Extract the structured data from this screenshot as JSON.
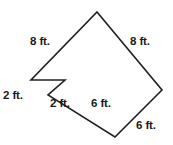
{
  "figure": {
    "shape_name": "notched-square-polygon",
    "stroke_color": "#231f20",
    "fill_color": "#ffffff",
    "background_color": "#ffffff",
    "stroke_width": 1.6,
    "unit": "ft.",
    "outline_points": "97,12 162,90 115,137 48,95 65,80 31,80",
    "vertices": [
      {
        "name": "top-apex",
        "x": 97,
        "y": 12
      },
      {
        "name": "right-vertex",
        "x": 162,
        "y": 90
      },
      {
        "name": "bottom-vertex",
        "x": 115,
        "y": 137
      },
      {
        "name": "notch-valley",
        "x": 48,
        "y": 95
      },
      {
        "name": "notch-peak",
        "x": 65,
        "y": 80
      },
      {
        "name": "left-vertex",
        "x": 31,
        "y": 80
      }
    ],
    "edges": [
      {
        "name": "edge-top-left",
        "from": "left-vertex",
        "to": "top-apex",
        "label": "8 ft."
      },
      {
        "name": "edge-top-right",
        "from": "top-apex",
        "to": "right-vertex",
        "label": "8 ft."
      },
      {
        "name": "edge-bottom-right",
        "from": "right-vertex",
        "to": "bottom-vertex",
        "label": "6 ft."
      },
      {
        "name": "edge-bottom-left",
        "from": "bottom-vertex",
        "to": "notch-valley",
        "label": "6 ft."
      },
      {
        "name": "edge-notch-right",
        "from": "notch-valley",
        "to": "notch-peak",
        "label": "2 ft."
      },
      {
        "name": "edge-notch-left",
        "from": "notch-peak",
        "to": "left-vertex",
        "label": "2 ft."
      }
    ],
    "labels": [
      {
        "name": "label-8ft-top-left",
        "text": "8 ft.",
        "left": 30,
        "top": 36
      },
      {
        "name": "label-8ft-top-right",
        "text": "8 ft.",
        "left": 130,
        "top": 36
      },
      {
        "name": "label-2ft-left",
        "text": "2 ft.",
        "left": 3,
        "top": 90
      },
      {
        "name": "label-2ft-notch",
        "text": "2 ft.",
        "left": 50,
        "top": 98
      },
      {
        "name": "label-6ft-lower-middle",
        "text": "6 ft.",
        "left": 91,
        "top": 98
      },
      {
        "name": "label-6ft-lower-right",
        "text": "6 ft.",
        "left": 136,
        "top": 120
      }
    ]
  }
}
